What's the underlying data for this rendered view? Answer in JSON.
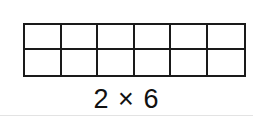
{
  "diagram": {
    "rows": 2,
    "cols": 6,
    "label": "2 × 6",
    "line_color": "#1a1a1a"
  }
}
